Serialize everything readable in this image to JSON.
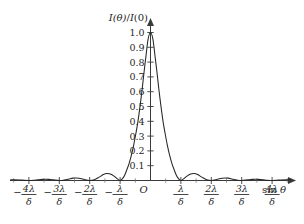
{
  "figure": {
    "background_color": "#ffffff",
    "line_color": "#262626",
    "axis_color": "#3a3a3a",
    "y_axis_label": "I(θ)/I(0)",
    "y_axis_label_parts": {
      "i1": "I",
      "theta": "(θ)",
      "slash": "/",
      "i2": "I",
      "zero": "(0)"
    },
    "x_axis_label": "sin θ",
    "x_axis_label_parts": {
      "sin": "sin",
      "theta": "θ"
    },
    "origin_label": "O"
  },
  "chart_data": {
    "type": "line",
    "title": "",
    "subtitle": "",
    "xlabel": "sin θ",
    "ylabel": "I(θ)/I(0)",
    "xlim": [
      -4.6,
      4.85
    ],
    "ylim": [
      0,
      1.06
    ],
    "grid": false,
    "legend": null,
    "x_unit": "λ/δ",
    "function": "single-slit diffraction intensity, sinc^2(pi*x)",
    "y_ticks": [
      {
        "value": 0.1,
        "label": "0.1"
      },
      {
        "value": 0.2,
        "label": "0.2"
      },
      {
        "value": 0.3,
        "label": "0.3"
      },
      {
        "value": 0.4,
        "label": "0.4"
      },
      {
        "value": 0.5,
        "label": "0.5"
      },
      {
        "value": 0.6,
        "label": "0.6"
      },
      {
        "value": 0.7,
        "label": "0.7"
      },
      {
        "value": 0.8,
        "label": "0.8"
      },
      {
        "value": 0.9,
        "label": "0.9"
      },
      {
        "value": 1.0,
        "label": "1.0"
      }
    ],
    "x_ticks": [
      {
        "value": -4,
        "sign": "−",
        "numerator": "4λ",
        "denominator": "δ"
      },
      {
        "value": -3,
        "sign": "−",
        "numerator": "3λ",
        "denominator": "δ"
      },
      {
        "value": -2,
        "sign": "−",
        "numerator": "2λ",
        "denominator": "δ"
      },
      {
        "value": -1,
        "sign": "−",
        "numerator": "λ",
        "denominator": "δ"
      },
      {
        "value": 0,
        "sign": "",
        "numerator": "O",
        "denominator": ""
      },
      {
        "value": 1,
        "sign": "",
        "numerator": "λ",
        "denominator": "δ"
      },
      {
        "value": 2,
        "sign": "",
        "numerator": "2λ",
        "denominator": "δ"
      },
      {
        "value": 3,
        "sign": "",
        "numerator": "3λ",
        "denominator": "δ"
      },
      {
        "value": 4,
        "sign": "",
        "numerator": "4λ",
        "denominator": "δ"
      }
    ],
    "x_minor_ticks": [
      -4.5,
      -3.5,
      -2.5,
      -1.5,
      -0.5,
      0.5,
      1.5,
      2.5,
      3.5,
      4.5
    ],
    "peaks": [
      {
        "x": 0.0,
        "y": 1.0
      },
      {
        "x": 1.43,
        "y": 0.047
      },
      {
        "x": -1.43,
        "y": 0.047
      },
      {
        "x": 2.46,
        "y": 0.017
      },
      {
        "x": -2.46,
        "y": 0.017
      },
      {
        "x": 3.47,
        "y": 0.008
      },
      {
        "x": -3.47,
        "y": 0.008
      },
      {
        "x": 4.48,
        "y": 0.005
      },
      {
        "x": -4.48,
        "y": 0.005
      }
    ],
    "zeros": [
      -4,
      -3,
      -2,
      -1,
      1,
      2,
      3,
      4
    ],
    "x": [
      -4.6,
      -4.48,
      -4.3,
      -4.15,
      -4.0,
      -3.85,
      -3.7,
      -3.55,
      -3.47,
      -3.35,
      -3.2,
      -3.0,
      -2.85,
      -2.7,
      -2.56,
      -2.46,
      -2.35,
      -2.2,
      -2.0,
      -1.85,
      -1.7,
      -1.55,
      -1.43,
      -1.32,
      -1.2,
      -1.1,
      -1.0,
      -0.92,
      -0.85,
      -0.78,
      -0.7,
      -0.62,
      -0.55,
      -0.48,
      -0.42,
      -0.35,
      -0.28,
      -0.22,
      -0.15,
      -0.08,
      0.0,
      0.08,
      0.15,
      0.22,
      0.28,
      0.35,
      0.42,
      0.48,
      0.55,
      0.62,
      0.7,
      0.78,
      0.85,
      0.92,
      1.0,
      1.1,
      1.2,
      1.32,
      1.43,
      1.55,
      1.7,
      1.85,
      2.0,
      2.2,
      2.35,
      2.46,
      2.56,
      2.7,
      2.85,
      3.0,
      3.2,
      3.35,
      3.47,
      3.55,
      3.7,
      3.85,
      4.0,
      4.15,
      4.3,
      4.48,
      4.6
    ],
    "y": [
      0.0043,
      0.005,
      0.0037,
      0.0013,
      0.0,
      0.0015,
      0.0048,
      0.0076,
      0.0082,
      0.0077,
      0.0046,
      0.0,
      0.0025,
      0.0086,
      0.016,
      0.0169,
      0.015,
      0.0078,
      0.0,
      0.0055,
      0.021,
      0.04,
      0.0472,
      0.044,
      0.03,
      0.0123,
      0.0,
      0.0131,
      0.036,
      0.072,
      0.118,
      0.179,
      0.243,
      0.319,
      0.389,
      0.492,
      0.608,
      0.718,
      0.839,
      0.954,
      1.0,
      0.954,
      0.839,
      0.718,
      0.608,
      0.492,
      0.389,
      0.319,
      0.243,
      0.179,
      0.118,
      0.072,
      0.036,
      0.0131,
      0.0,
      0.0123,
      0.03,
      0.044,
      0.0472,
      0.04,
      0.021,
      0.0055,
      0.0,
      0.0078,
      0.015,
      0.0169,
      0.016,
      0.0086,
      0.0025,
      0.0,
      0.0046,
      0.0077,
      0.0082,
      0.0076,
      0.0048,
      0.0015,
      0.0,
      0.0013,
      0.0037,
      0.005,
      0.0043
    ]
  }
}
